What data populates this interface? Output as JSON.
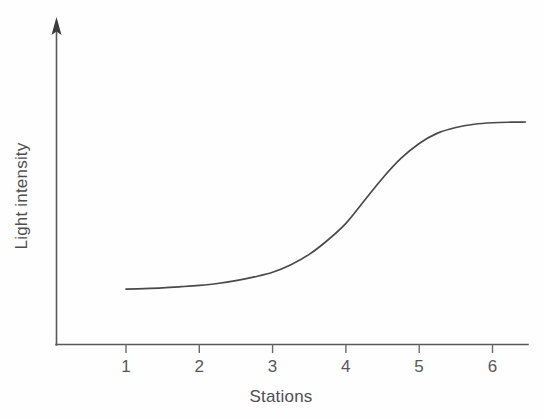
{
  "figure": {
    "background_color": "#fefefe",
    "width": 545,
    "height": 419
  },
  "chart_data": {
    "type": "line",
    "title": "",
    "subtitle": "",
    "xlabel": "Stations",
    "ylabel": "Light intensity",
    "xlim": [
      0.0,
      6.5
    ],
    "ylim": [
      0,
      1
    ],
    "grid": false,
    "legend": null,
    "legend_position": "none",
    "x_tick_labels": [
      "1",
      "2",
      "3",
      "4",
      "5",
      "6"
    ],
    "x_ticks": [
      1,
      2,
      3,
      4,
      5,
      6
    ],
    "y_tick_labels": [],
    "y_ticks": [],
    "annotations": [],
    "series": [
      {
        "name": "Light intensity",
        "color": "#4a4a4c",
        "style": "smooth-sigmoid",
        "x": [
          1.0,
          1.25,
          1.5,
          1.75,
          2.0,
          2.25,
          2.5,
          2.75,
          3.0,
          3.25,
          3.5,
          3.75,
          4.0,
          4.25,
          4.5,
          4.75,
          5.0,
          5.25,
          5.5,
          5.75,
          6.0,
          6.25,
          6.45
        ],
        "values": [
          0.095,
          0.098,
          0.102,
          0.108,
          0.115,
          0.125,
          0.14,
          0.16,
          0.185,
          0.225,
          0.28,
          0.355,
          0.445,
          0.565,
          0.685,
          0.79,
          0.87,
          0.925,
          0.955,
          0.972,
          0.98,
          0.983,
          0.984
        ]
      }
    ],
    "axis_style": {
      "y_axis_arrow": true,
      "x_axis_arrow": false,
      "spines": [
        "left",
        "bottom"
      ],
      "axis_color": "#58585a"
    }
  },
  "icons": {
    "y_axis_arrow": "arrow-up-icon"
  }
}
